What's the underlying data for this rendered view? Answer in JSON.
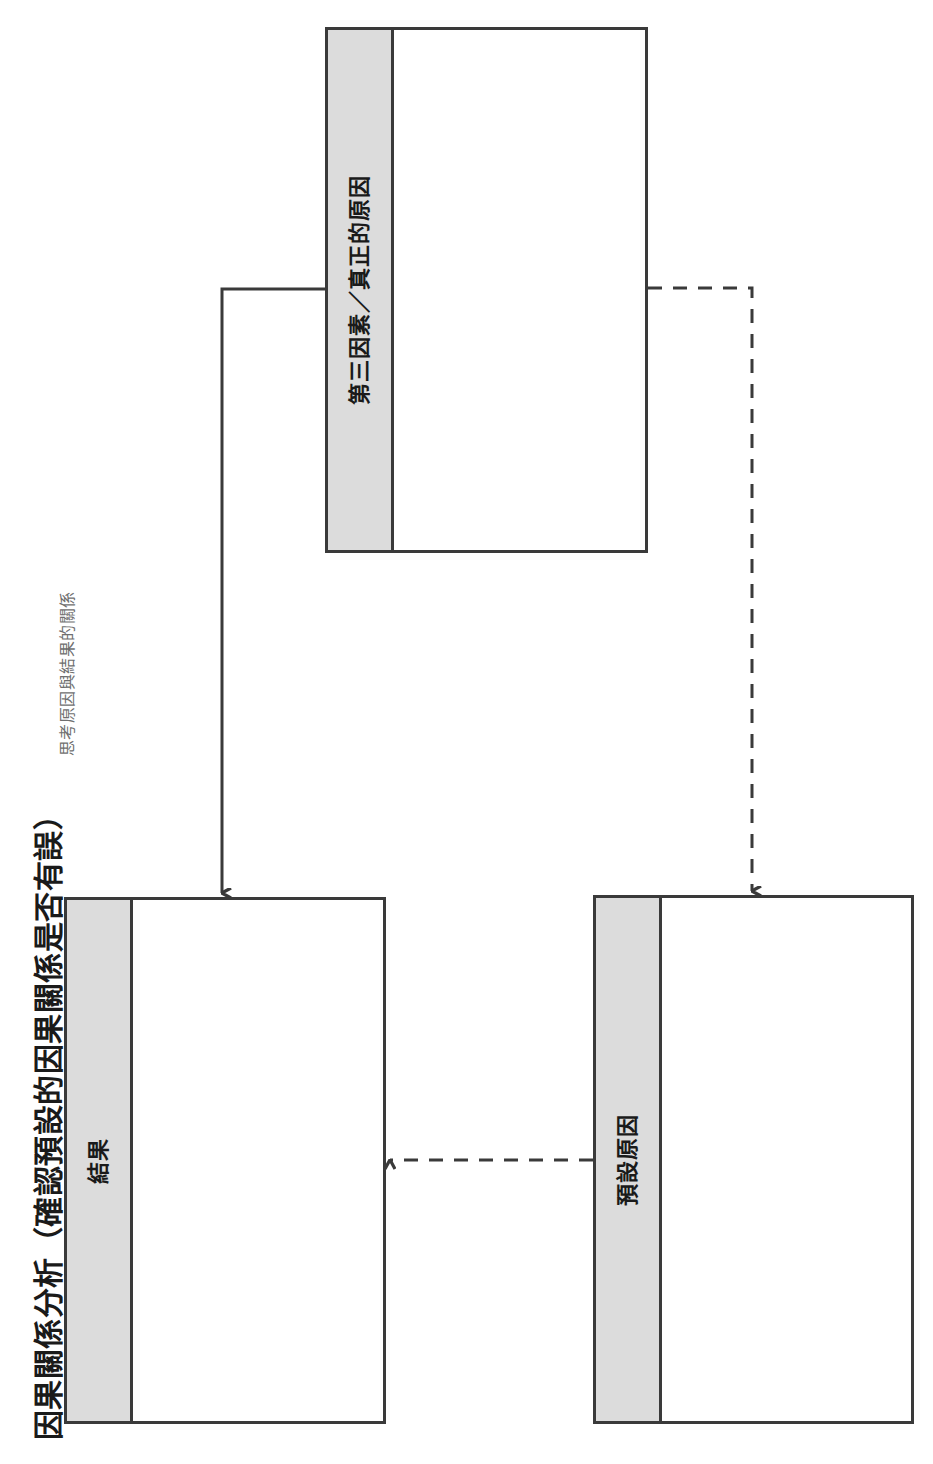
{
  "heading": {
    "title": "因果關係分析（確認預設的因果關係是否有誤）",
    "subtitle": "思考原因與結果的關係"
  },
  "colors": {
    "band_fill": "#dcdcdc",
    "stroke": "#3a3a3a",
    "box_fill": "#ffffff",
    "title_color": "#1a1a1a",
    "subtitle_color": "#6f6f6f",
    "page_background": "#ffffff"
  },
  "boxes": [
    {
      "id": "third-factor",
      "label": "第三因素／真正的原因",
      "content": ""
    },
    {
      "id": "effect",
      "label": "結果",
      "content": ""
    },
    {
      "id": "assumed-cause",
      "label": "預設原因",
      "content": ""
    }
  ],
  "connectors": [
    {
      "id": "third-to-effect",
      "from": "third-factor",
      "to": "effect",
      "style": "solid",
      "arrow": "end",
      "direction": "down"
    },
    {
      "id": "third-to-cause",
      "from": "third-factor",
      "to": "assumed-cause",
      "style": "dashed",
      "arrow": "end",
      "direction": "down"
    },
    {
      "id": "cause-to-effect",
      "from": "assumed-cause",
      "to": "effect",
      "style": "dashed",
      "arrow": "end",
      "direction": "left"
    }
  ]
}
